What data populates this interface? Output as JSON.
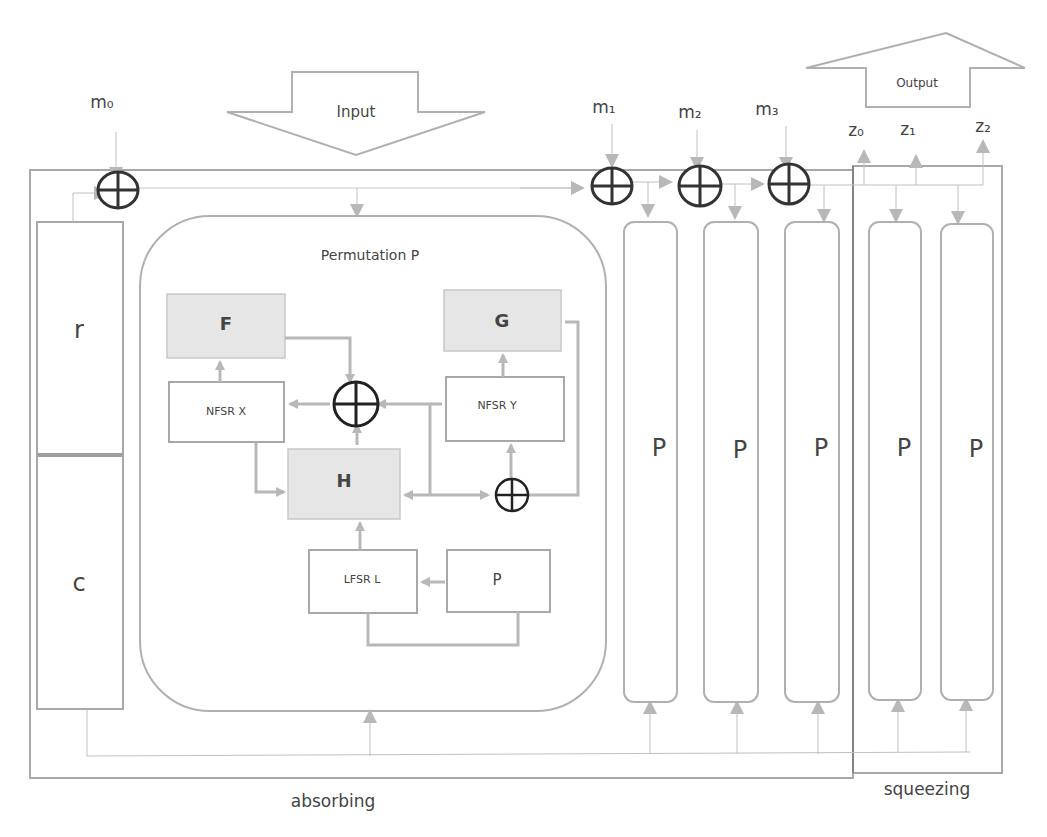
{
  "diagram": {
    "input_arrow": {
      "label": "Input"
    },
    "output_arrow": {
      "label": "Output"
    },
    "message_inputs": [
      {
        "label": "m₀"
      },
      {
        "label": "m₁"
      },
      {
        "label": "m₂"
      },
      {
        "label": "m₃"
      }
    ],
    "output_values": [
      {
        "label": "z₀"
      },
      {
        "label": "z₁"
      },
      {
        "label": "z₂"
      }
    ],
    "state": {
      "rate_label": "r",
      "capacity_label": "c"
    },
    "permutation": {
      "title": "Permutation P",
      "blocks": {
        "f": "F",
        "g": "G",
        "h": "H",
        "nfsr_x": "NFSR X",
        "nfsr_y": "NFSR Y",
        "lfsr_l": "LFSR L",
        "p": "P"
      }
    },
    "absorb_permutations": [
      {
        "label": "P"
      },
      {
        "label": "P"
      },
      {
        "label": "P"
      }
    ],
    "squeeze_permutations": [
      {
        "label": "P"
      },
      {
        "label": "P"
      }
    ],
    "phases": {
      "absorbing": "absorbing",
      "squeezing": "squeezing"
    },
    "colors": {
      "line": "#b0b0b0",
      "xor": "#333333",
      "shaded_block": "#e6e6e6"
    }
  }
}
